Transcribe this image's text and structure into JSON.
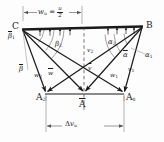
{
  "figure": {
    "colors": {
      "stroke": "#1a1a1a",
      "light_stroke": "#8a8a8a",
      "background": "#fdfdfd"
    },
    "points": {
      "c": "C",
      "b": "B",
      "a2": "A",
      "a2_sub": "2",
      "a0": "A",
      "a0_sub": "0",
      "a_mean": "A"
    },
    "angles": {
      "beta_bar_1": "β",
      "beta_bar_1_sub": "1",
      "beta_2": "β",
      "beta_2_sub": "2",
      "beta_bar": "β",
      "alpha_2": "α",
      "alpha_2_sub": "2",
      "alpha_bar": "α",
      "alpha_1": "α",
      "alpha_1_sub": "1"
    },
    "vectors": {
      "w2": "w",
      "w2_sub": "2",
      "w_bar": "w",
      "w1": "w",
      "w1_sub": "1",
      "v1": "v",
      "v1_sub": "1",
      "v2": "v",
      "v2_sub": "2",
      "v_bar": "v"
    },
    "dimensions": {
      "top_label_main": "w",
      "top_label_main_sub": "u",
      "top_label_eq": "=",
      "top_label_num": "u",
      "top_label_den": "2",
      "bottom_label_delta": "Δ",
      "bottom_label_var": "v",
      "bottom_label_sub": "u"
    }
  }
}
